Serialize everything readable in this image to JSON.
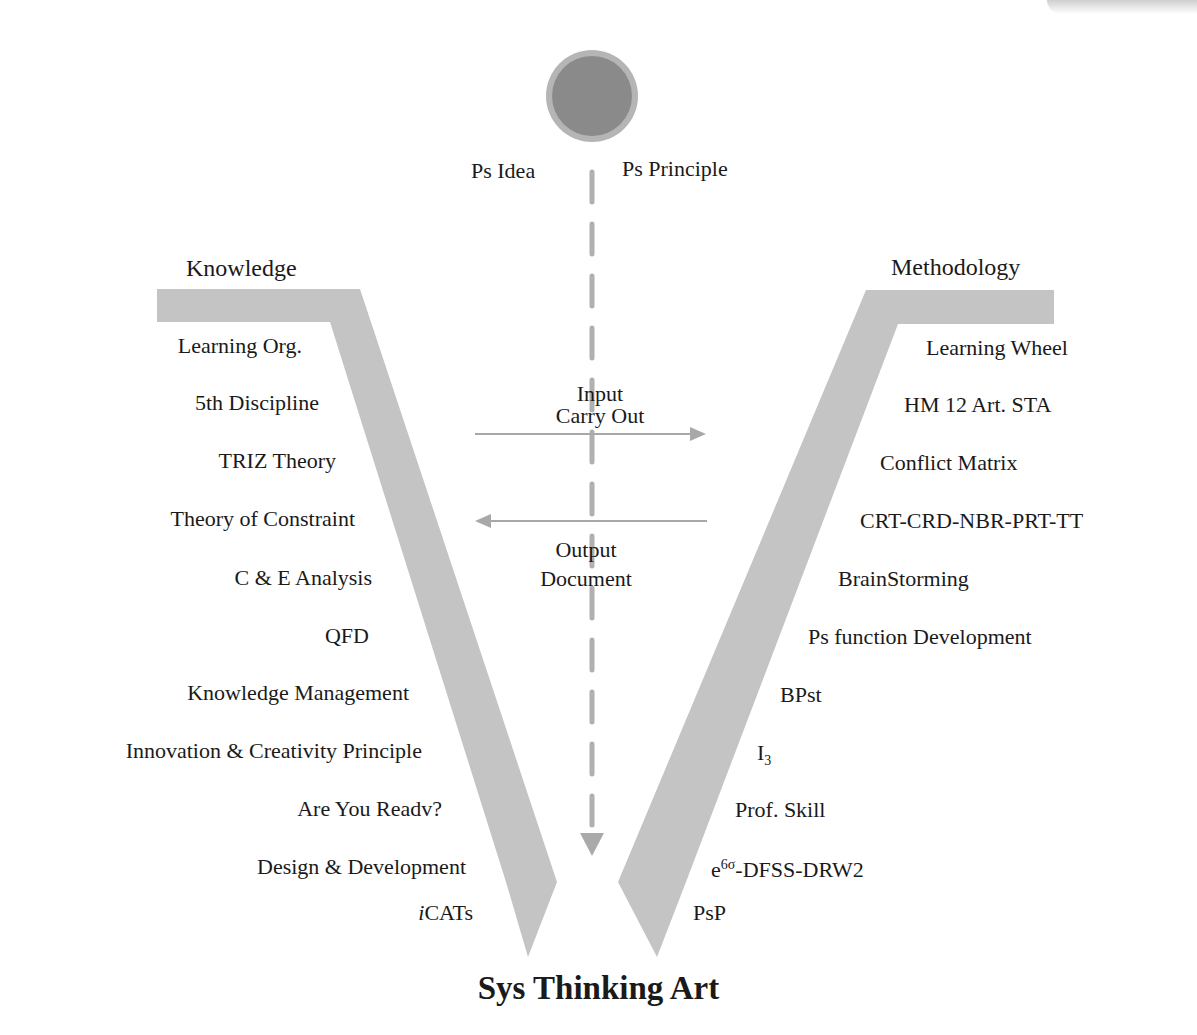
{
  "title": "Sys Thinking Art",
  "top_node": {
    "left_label": "Ps Idea",
    "right_label": "Ps Principle"
  },
  "left_arm": {
    "header": "Knowledge",
    "items": [
      "Learning Org.",
      "5th Discipline",
      "TRIZ Theory",
      "Theory of Constraint",
      "C & E Analysis",
      "QFD",
      "Knowledge Management",
      "Innovation & Creativity Principle",
      "Are You Readv?",
      "Design & Development"
    ],
    "last_item": {
      "italic_prefix": "i",
      "rest": "CATs"
    }
  },
  "right_arm": {
    "header": "Methodology",
    "items": [
      "Learning Wheel",
      "HM 12 Art. STA",
      "Conflict Matrix",
      "CRT-CRD-NBR-PRT-TT",
      "BrainStorming",
      "Ps function Development",
      "BPst"
    ],
    "i3": {
      "base": "I",
      "sub": "3"
    },
    "prof_skill": "Prof. Skill",
    "e6sigma": {
      "base": "e",
      "sup": "6σ",
      "rest": "-DFSS-DRW2"
    },
    "psp": "PsP"
  },
  "center": {
    "input_line1": "Input",
    "input_line2": "Carry Out",
    "output_line1": "Output",
    "output_line2": "Document"
  },
  "colors": {
    "band": "#c4c4c4",
    "circle_fill": "#8a8a8a",
    "circle_ring": "#b5b5b5",
    "dash": "#b0b0b0",
    "arrow": "#a8a8a8"
  }
}
